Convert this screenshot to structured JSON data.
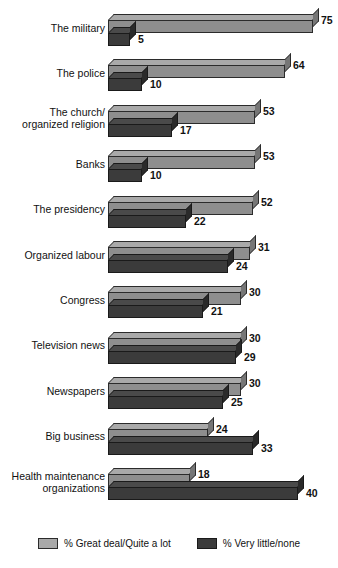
{
  "chart_data": {
    "type": "bar",
    "title": "",
    "subtitle": "",
    "xlabel": "",
    "ylabel": "",
    "orientation": "horizontal",
    "grid": false,
    "legend_position": "bottom",
    "note": "Bar lengths in the source graphic are not drawn to a linear scale; pixel lengths are reproduced as rendered.",
    "categories": [
      "The military",
      "The police",
      "The church/\norganized religion",
      "Banks",
      "The presidency",
      "Organized labour",
      "Congress",
      "Television news",
      "Newspapers",
      "Big business",
      "Health maintenance\norganizations"
    ],
    "series": [
      {
        "name": "% Great deal/Quite a lot",
        "color": "#a9a9a9",
        "values": [
          75,
          64,
          53,
          53,
          52,
          31,
          30,
          30,
          30,
          24,
          18
        ]
      },
      {
        "name": "% Very little/none",
        "color": "#3b3b3b",
        "values": [
          5,
          10,
          17,
          10,
          22,
          24,
          21,
          29,
          25,
          33,
          40
        ]
      }
    ]
  },
  "legend": {
    "items": [
      {
        "label": "% Great deal/Quite a lot",
        "swatch": "light-gray-swatch"
      },
      {
        "label": "% Very little/none",
        "swatch": "dark-gray-swatch"
      }
    ]
  }
}
